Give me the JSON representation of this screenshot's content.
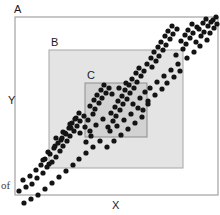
{
  "figure": {
    "kind": "scatter-diagram",
    "background_color": "#ffffff",
    "axes": {
      "x_label": "X",
      "y_label": "Y"
    },
    "frame": {
      "label": "A",
      "x": 15,
      "y": 17,
      "width": 203,
      "height": 178,
      "stroke": "#9a9a9a",
      "fill": "none"
    },
    "regions": [
      {
        "label": "B",
        "x": 49,
        "y": 50,
        "width": 134,
        "height": 118,
        "fill": "#e4e4e4",
        "stroke": "#a6a6a6",
        "label_x": 51,
        "label_y": 46
      },
      {
        "label": "C",
        "x": 85,
        "y": 83,
        "width": 62,
        "height": 54,
        "fill": "#d2d2d2",
        "stroke": "#8d8d8d",
        "label_x": 87,
        "label_y": 79
      }
    ],
    "label_positions": {
      "frame_label_x": 14,
      "frame_label_y": 13,
      "y_label_x": 8,
      "y_label_y": 104,
      "x_label_x": 112,
      "x_label_y": 209
    },
    "stray_marginalia": [
      {
        "text": "of",
        "x": 1,
        "y": 189
      }
    ]
  },
  "chart_data": {
    "type": "scatter",
    "title": "",
    "xlabel": "X",
    "ylabel": "Y",
    "grid": false,
    "legend": null,
    "xlim": [
      0,
      220
    ],
    "ylim": [
      0,
      215
    ],
    "marker_radius": 2.6,
    "marker_color": "#141414",
    "annotations": [
      {
        "text": "A",
        "x": 14,
        "y": 13
      },
      {
        "text": "B",
        "x": 51,
        "y": 46
      },
      {
        "text": "C",
        "x": 87,
        "y": 79
      }
    ],
    "points": [
      [
        19,
        191
      ],
      [
        26,
        187
      ],
      [
        23,
        180
      ],
      [
        32,
        184
      ],
      [
        30,
        176
      ],
      [
        37,
        178
      ],
      [
        36,
        170
      ],
      [
        43,
        173
      ],
      [
        41,
        165
      ],
      [
        47,
        167
      ],
      [
        45,
        159
      ],
      [
        52,
        162
      ],
      [
        50,
        154
      ],
      [
        56,
        157
      ],
      [
        54,
        148
      ],
      [
        60,
        151
      ],
      [
        58,
        143
      ],
      [
        63,
        146
      ],
      [
        62,
        138
      ],
      [
        67,
        141
      ],
      [
        65,
        133
      ],
      [
        70,
        136
      ],
      [
        69,
        128
      ],
      [
        74,
        131
      ],
      [
        72,
        123
      ],
      [
        77,
        126
      ],
      [
        76,
        118
      ],
      [
        80,
        121
      ],
      [
        79,
        113
      ],
      [
        84,
        116
      ],
      [
        43,
        160
      ],
      [
        48,
        152
      ],
      [
        55,
        146
      ],
      [
        61,
        140
      ],
      [
        66,
        134
      ],
      [
        71,
        128
      ],
      [
        49,
        164
      ],
      [
        56,
        138
      ],
      [
        63,
        132
      ],
      [
        70,
        124
      ],
      [
        75,
        119
      ],
      [
        80,
        133
      ],
      [
        85,
        127
      ],
      [
        86,
        142
      ],
      [
        91,
        136
      ],
      [
        88,
        120
      ],
      [
        93,
        114
      ],
      [
        90,
        106
      ],
      [
        95,
        109
      ],
      [
        94,
        100
      ],
      [
        99,
        103
      ],
      [
        97,
        95
      ],
      [
        102,
        98
      ],
      [
        101,
        90
      ],
      [
        106,
        93
      ],
      [
        104,
        85
      ],
      [
        109,
        88
      ],
      [
        108,
        127
      ],
      [
        113,
        121
      ],
      [
        111,
        113
      ],
      [
        116,
        116
      ],
      [
        115,
        107
      ],
      [
        120,
        110
      ],
      [
        118,
        101
      ],
      [
        123,
        104
      ],
      [
        122,
        96
      ],
      [
        127,
        99
      ],
      [
        125,
        90
      ],
      [
        130,
        93
      ],
      [
        129,
        85
      ],
      [
        134,
        88
      ],
      [
        132,
        79
      ],
      [
        137,
        82
      ],
      [
        136,
        73
      ],
      [
        141,
        76
      ],
      [
        139,
        68
      ],
      [
        144,
        71
      ],
      [
        90,
        131
      ],
      [
        96,
        125
      ],
      [
        103,
        119
      ],
      [
        110,
        131
      ],
      [
        117,
        126
      ],
      [
        124,
        120
      ],
      [
        131,
        114
      ],
      [
        138,
        108
      ],
      [
        112,
        94
      ],
      [
        119,
        88
      ],
      [
        126,
        83
      ],
      [
        133,
        104
      ],
      [
        140,
        98
      ],
      [
        145,
        92
      ],
      [
        143,
        110
      ],
      [
        148,
        104
      ],
      [
        147,
        64
      ],
      [
        152,
        67
      ],
      [
        151,
        58
      ],
      [
        156,
        61
      ],
      [
        154,
        52
      ],
      [
        159,
        56
      ],
      [
        158,
        47
      ],
      [
        163,
        50
      ],
      [
        161,
        42
      ],
      [
        166,
        45
      ],
      [
        165,
        36
      ],
      [
        170,
        39
      ],
      [
        168,
        31
      ],
      [
        173,
        34
      ],
      [
        172,
        26
      ],
      [
        177,
        29
      ],
      [
        150,
        88
      ],
      [
        157,
        82
      ],
      [
        164,
        76
      ],
      [
        171,
        70
      ],
      [
        178,
        64
      ],
      [
        176,
        55
      ],
      [
        183,
        49
      ],
      [
        181,
        41
      ],
      [
        186,
        44
      ],
      [
        185,
        35
      ],
      [
        190,
        38
      ],
      [
        188,
        30
      ],
      [
        193,
        33
      ],
      [
        192,
        24
      ],
      [
        197,
        27
      ],
      [
        196,
        42
      ],
      [
        201,
        36
      ],
      [
        199,
        29
      ],
      [
        204,
        32
      ],
      [
        203,
        23
      ],
      [
        208,
        26
      ],
      [
        206,
        19
      ],
      [
        211,
        22
      ],
      [
        210,
        33
      ],
      [
        214,
        28
      ],
      [
        213,
        20
      ],
      [
        217,
        24
      ],
      [
        216,
        17
      ],
      [
        207,
        40
      ],
      [
        200,
        46
      ],
      [
        194,
        52
      ],
      [
        187,
        58
      ],
      [
        180,
        71
      ],
      [
        174,
        77
      ],
      [
        167,
        83
      ],
      [
        162,
        89
      ],
      [
        155,
        95
      ],
      [
        148,
        101
      ],
      [
        142,
        117
      ],
      [
        135,
        123
      ],
      [
        128,
        129
      ],
      [
        121,
        135
      ],
      [
        114,
        141
      ],
      [
        107,
        147
      ],
      [
        100,
        141
      ],
      [
        93,
        147
      ],
      [
        86,
        153
      ],
      [
        79,
        159
      ],
      [
        73,
        165
      ],
      [
        66,
        171
      ],
      [
        59,
        177
      ],
      [
        52,
        183
      ],
      [
        38,
        195
      ],
      [
        45,
        189
      ],
      [
        31,
        199
      ],
      [
        24,
        203
      ]
    ]
  }
}
